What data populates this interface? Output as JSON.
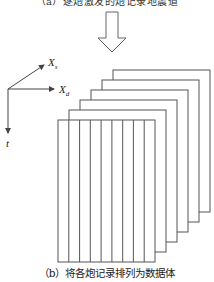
{
  "figure": {
    "top_caption": "（a）逐炮激发的炮记录地震道",
    "bottom_caption": "（b）将各炮记录排列为数据体",
    "arrow": {
      "direction": "down",
      "style": "hollow"
    },
    "axes": {
      "xs_label": "X",
      "xs_sub": "s",
      "xd_label": "X",
      "xd_sub": "d",
      "t_label": "t"
    },
    "volume": {
      "panel_count": 6,
      "front_panel_strips": 9,
      "line_color": "#555555",
      "background_color": "#ffffff"
    }
  }
}
